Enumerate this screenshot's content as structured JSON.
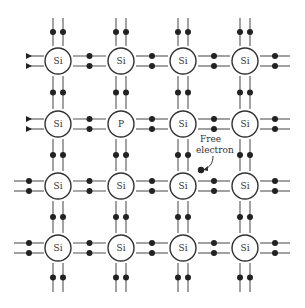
{
  "diagram": {
    "title": "",
    "atoms": [
      {
        "row": 0,
        "col": 0,
        "label": "Si"
      },
      {
        "row": 0,
        "col": 1,
        "label": "Si"
      },
      {
        "row": 0,
        "col": 2,
        "label": "Si"
      },
      {
        "row": 0,
        "col": 3,
        "label": "Si"
      },
      {
        "row": 1,
        "col": 0,
        "label": "Si"
      },
      {
        "row": 1,
        "col": 1,
        "label": "P"
      },
      {
        "row": 1,
        "col": 2,
        "label": "Si"
      },
      {
        "row": 1,
        "col": 3,
        "label": "Si"
      },
      {
        "row": 2,
        "col": 0,
        "label": "Si"
      },
      {
        "row": 2,
        "col": 1,
        "label": "Si"
      },
      {
        "row": 2,
        "col": 2,
        "label": "Si"
      },
      {
        "row": 2,
        "col": 3,
        "label": "Si"
      },
      {
        "row": 3,
        "col": 0,
        "label": "Si"
      },
      {
        "row": 3,
        "col": 1,
        "label": "Si"
      },
      {
        "row": 3,
        "col": 2,
        "label": "Si"
      },
      {
        "row": 3,
        "col": 3,
        "label": "Si"
      }
    ],
    "annotation": {
      "line1": "Free",
      "line2": "electron"
    },
    "colors": {
      "stroke": "#333333",
      "electron": "#222222",
      "background": "#ffffff"
    }
  }
}
